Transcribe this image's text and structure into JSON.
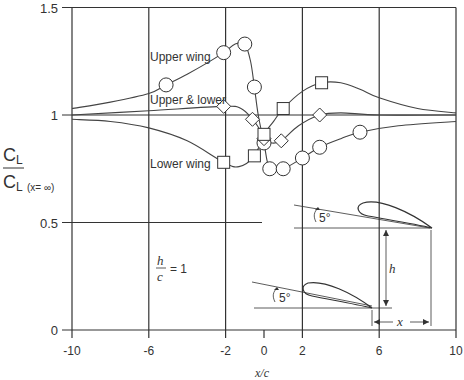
{
  "chart_data": {
    "type": "line",
    "title": "",
    "xlabel": "x/c",
    "ylabel": "C_L / C_L(x=∞)",
    "ylabel_numerator": "C",
    "ylabel_numerator_sub": "L",
    "ylabel_denominator": "C",
    "ylabel_denominator_sub": "L",
    "ylabel_denominator_cond": "(x= ∞)",
    "xlim": [
      -10,
      10
    ],
    "ylim": [
      0,
      1.5
    ],
    "x_ticks": [
      -10,
      -6,
      -2,
      0,
      2,
      6,
      10
    ],
    "x_tick_labels": [
      "-10",
      "-6",
      "-2",
      "0",
      "2",
      "6",
      "10"
    ],
    "y_ticks": [
      0,
      0.5,
      1,
      1.5
    ],
    "y_tick_labels": [
      "0",
      "0.5",
      "1",
      "1.5"
    ],
    "grid": true,
    "annotation": {
      "h_over_c_num": "h",
      "h_over_c_den": "c",
      "h_over_c_eq": "= 1"
    },
    "series": [
      {
        "name": "Upper wing",
        "marker": "circle",
        "label": "Upper wing",
        "x": [
          -5.1,
          -2.1,
          -1.0,
          -0.5,
          0.0,
          0.3,
          1.0,
          2.0,
          2.9,
          5.0
        ],
        "y": [
          1.14,
          1.29,
          1.33,
          1.13,
          0.87,
          0.75,
          0.75,
          0.8,
          0.85,
          0.92
        ],
        "curve_x": [
          -10,
          -8,
          -6,
          -5.1,
          -4,
          -3,
          -2.1,
          -1.5,
          -1.0,
          -0.7,
          -0.5,
          -0.3,
          0.0,
          0.3,
          1.0,
          2.0,
          2.9,
          4,
          5.0,
          7,
          10
        ],
        "curve_y": [
          1.03,
          1.06,
          1.1,
          1.14,
          1.19,
          1.24,
          1.29,
          1.33,
          1.33,
          1.25,
          1.13,
          1.0,
          0.87,
          0.75,
          0.75,
          0.8,
          0.85,
          0.89,
          0.92,
          0.95,
          0.97
        ]
      },
      {
        "name": "Upper & lower",
        "marker": "diamond",
        "label": "Upper & lower",
        "x": [
          -2.1,
          -0.6,
          0.0,
          0.9,
          2.9
        ],
        "y": [
          1.04,
          0.98,
          0.89,
          0.88,
          1.0
        ],
        "curve_x": [
          -10,
          -6,
          -2.1,
          -1.2,
          -0.6,
          -0.2,
          0.0,
          0.4,
          0.9,
          1.8,
          2.9,
          4,
          6,
          10
        ],
        "curve_y": [
          1.0,
          1.02,
          1.04,
          1.03,
          0.98,
          0.93,
          0.89,
          0.87,
          0.88,
          0.95,
          1.0,
          1.01,
          1.0,
          1.0
        ]
      },
      {
        "name": "Lower wing",
        "marker": "square",
        "label": "Lower wing",
        "x": [
          -2.1,
          -0.5,
          0.0,
          1.0,
          3.0
        ],
        "y": [
          0.78,
          0.81,
          0.91,
          1.03,
          1.15
        ],
        "curve_x": [
          -10,
          -8,
          -6,
          -4,
          -2.1,
          -1.3,
          -0.5,
          0.0,
          0.5,
          1.0,
          2.0,
          3.0,
          4,
          5,
          6,
          8,
          10
        ],
        "curve_y": [
          0.98,
          0.97,
          0.94,
          0.88,
          0.78,
          0.76,
          0.81,
          0.91,
          0.97,
          1.03,
          1.11,
          1.15,
          1.15,
          1.12,
          1.08,
          1.03,
          1.01
        ]
      }
    ]
  },
  "diagram": {
    "angle_upper": "5°",
    "angle_lower": "5°",
    "gap_label": "h",
    "stagger_label": "x"
  }
}
